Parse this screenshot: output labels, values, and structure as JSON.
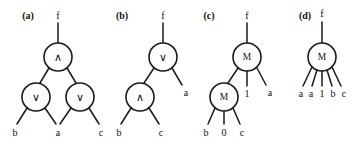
{
  "figure": {
    "panels": [
      {
        "id": "a",
        "label": "(a)",
        "output_label": "f",
        "gates": [
          {
            "name": "root-and-gate",
            "symbol": "∧",
            "kind": "and"
          },
          {
            "name": "left-or-gate",
            "symbol": "∨",
            "kind": "or"
          },
          {
            "name": "right-or-gate",
            "symbol": "∨",
            "kind": "or"
          }
        ],
        "inputs": [
          "b",
          "a",
          "c"
        ]
      },
      {
        "id": "b",
        "label": "(b)",
        "output_label": "f",
        "gates": [
          {
            "name": "root-or-gate",
            "symbol": "∨",
            "kind": "or"
          },
          {
            "name": "child-and-gate",
            "symbol": "∧",
            "kind": "and"
          }
        ],
        "inputs": [
          "b",
          "c",
          "a"
        ]
      },
      {
        "id": "c",
        "label": "(c)",
        "output_label": "f",
        "gates": [
          {
            "name": "root-majority-gate",
            "symbol": "M",
            "kind": "majority"
          },
          {
            "name": "child-majority-gate",
            "symbol": "M",
            "kind": "majority"
          }
        ],
        "inputs": [
          "b",
          "0",
          "c",
          "1",
          "a"
        ]
      },
      {
        "id": "d",
        "label": "(d)",
        "output_label": "f",
        "gates": [
          {
            "name": "root-majority-gate",
            "symbol": "M",
            "kind": "majority"
          }
        ],
        "inputs": [
          "a",
          "a",
          "1",
          "b",
          "c"
        ]
      }
    ]
  },
  "colors": {
    "ink": "#1a1a1a",
    "background": "#ffffff"
  }
}
